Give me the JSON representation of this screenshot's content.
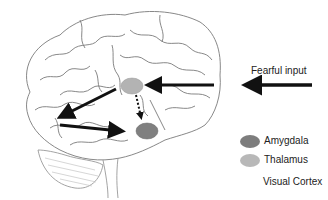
{
  "diagram": {
    "input_label": "Fearful input",
    "legend": [
      {
        "label": "Amygdala",
        "color": "#7d7d7d"
      },
      {
        "label": "Thalamus",
        "color": "#b8b8b8"
      },
      {
        "label": "Visual Cortex",
        "color": null
      }
    ],
    "regions": {
      "thalamus": {
        "name": "Thalamus",
        "color": "#b3b3b3"
      },
      "amygdala": {
        "name": "Amygdala",
        "color": "#808080"
      }
    },
    "arrows": [
      {
        "from": "Fearful input",
        "to": "Thalamus",
        "style": "solid"
      },
      {
        "from": "Thalamus",
        "to": "Visual Cortex",
        "style": "solid"
      },
      {
        "from": "Visual Cortex",
        "to": "Amygdala",
        "style": "solid"
      },
      {
        "from": "Thalamus",
        "to": "Amygdala",
        "style": "dotted"
      }
    ]
  }
}
